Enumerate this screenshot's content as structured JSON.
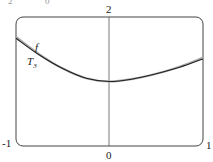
{
  "header_fragments": [
    "2",
    "0"
  ],
  "chart_data": {
    "type": "line",
    "title": "",
    "xlabel": "",
    "ylabel": "",
    "xlim": [
      -1,
      1
    ],
    "ylim": [
      0,
      2
    ],
    "x_tick_labels": {
      "left": "-1",
      "center": "0",
      "right": "1"
    },
    "y_tick_labels": {
      "top": "2"
    },
    "grid": false,
    "series": [
      {
        "name": "f",
        "color": "#aaaaaa",
        "x": [
          -1,
          -0.75,
          -0.5,
          -0.25,
          0,
          0.25,
          0.5,
          0.75,
          1
        ],
        "y": [
          1.69,
          1.42,
          1.2,
          1.05,
          1.0,
          1.04,
          1.12,
          1.23,
          1.37
        ]
      },
      {
        "name": "T_3",
        "color": "#222222",
        "x": [
          -1,
          -0.75,
          -0.5,
          -0.25,
          0,
          0.25,
          0.5,
          0.75,
          1
        ],
        "y": [
          1.67,
          1.41,
          1.2,
          1.05,
          1.0,
          1.04,
          1.12,
          1.22,
          1.35
        ]
      }
    ],
    "annotations": [
      {
        "text": "f",
        "x": -0.82,
        "y": 1.55
      },
      {
        "text": "T",
        "subscript": "3",
        "x": -0.88,
        "y": 1.3
      }
    ]
  }
}
